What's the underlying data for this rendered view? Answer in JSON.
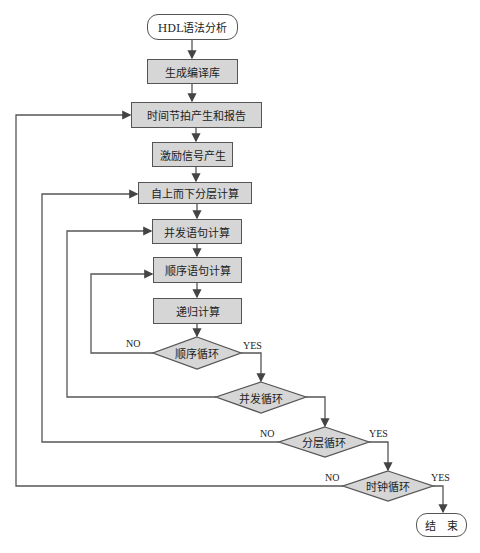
{
  "diagram": {
    "type": "flowchart",
    "nodes": {
      "start": "HDL语法分析",
      "gen_lib": "生成编译库",
      "time_step": "时间节拍产生和报告",
      "stimulus": "激励信号产生",
      "top_down": "自上而下分层计算",
      "concurrent": "并发语句计算",
      "sequential": "顺序语句计算",
      "recursive": "递归计算",
      "seq_loop": "顺序循环",
      "con_loop": "并发循环",
      "layer_loop": "分层循环",
      "clock_loop": "时钟循环",
      "end": "结　束"
    },
    "edge_labels": {
      "seq_no": "NO",
      "seq_yes": "YES",
      "layer_no": "NO",
      "layer_yes": "YES",
      "clock_no": "NO",
      "clock_yes": "YES"
    },
    "colors": {
      "process_fill": "#d6d6d6",
      "decision_fill": "#d6d6d6",
      "line": "#555555"
    }
  }
}
